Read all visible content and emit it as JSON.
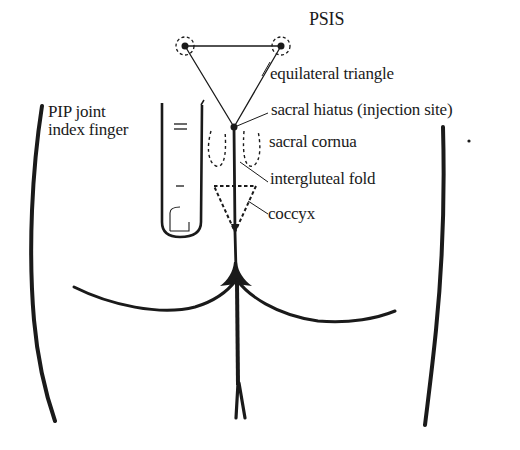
{
  "figure": {
    "colors": {
      "ink": "#1a1a1a",
      "background": "#ffffff"
    },
    "labels": {
      "psis": "PSIS",
      "equilateral_triangle": "equilateral triangle",
      "sacral_hiatus": "sacral hiatus (injection site)",
      "sacral_cornua": "sacral cornua",
      "intergluteal_fold": "intergluteal fold",
      "coccyx": "coccyx",
      "pip_joint_line1": "PIP joint",
      "pip_joint_line2": "index finger"
    }
  }
}
